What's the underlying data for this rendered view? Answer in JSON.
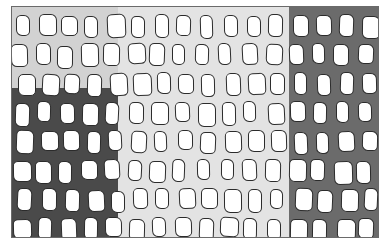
{
  "image": {
    "description": "Grayscale grid of rounded rectangular cells on shaded background regions",
    "frame": {
      "x": 11,
      "y": 6,
      "width": 368,
      "height": 232,
      "border_color": "#6a6a6a"
    },
    "colors": {
      "base_background": "#e3e3e3",
      "top_left_background": "#d2d2d2",
      "dark_left_background": "#4a4a4a",
      "dark_right_background": "#6b6b6b",
      "cell_fill": "#ffffff",
      "cell_outline": "#2b2b2b"
    },
    "regions": [
      {
        "name": "top-left-light-gray",
        "x": 0,
        "y": 0,
        "width": 106,
        "height": 81,
        "color": "#d2d2d2"
      },
      {
        "name": "bottom-left-dark",
        "x": 0,
        "y": 81,
        "width": 106,
        "height": 151,
        "color": "#4a4a4a"
      },
      {
        "name": "right-dark",
        "x": 277,
        "y": 0,
        "width": 91,
        "height": 232,
        "color": "#6b6b6b"
      }
    ],
    "grid": {
      "rows": 8,
      "cols": 16,
      "cell_width": 15,
      "cell_height": 22,
      "col_pitch": 23,
      "row_pitch": 29,
      "first_row_top": 8,
      "row_offsets": [
        4,
        0,
        6,
        2,
        5,
        0,
        6,
        2
      ]
    }
  }
}
